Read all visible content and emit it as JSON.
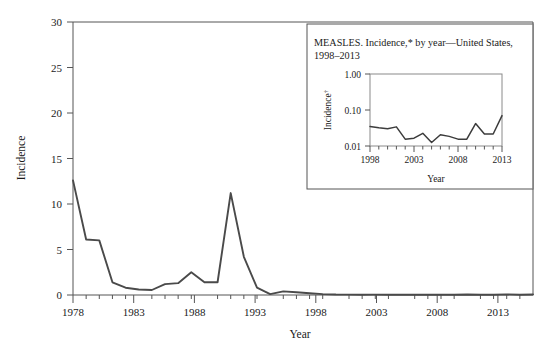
{
  "chart_data": [
    {
      "id": "main",
      "type": "line",
      "title": "",
      "xlabel": "Year",
      "ylabel": "Incidence",
      "xlim": [
        1978,
        2013
      ],
      "ylim": [
        0,
        30
      ],
      "yticks": [
        0,
        5,
        10,
        15,
        20,
        25,
        30
      ],
      "xticks": [
        1978,
        1983,
        1988,
        1993,
        1998,
        2003,
        2008,
        2013
      ],
      "xtick_labels": [
        "1978",
        "1983",
        "1988",
        "1993",
        "1998",
        "2003",
        "2008",
        "2013"
      ],
      "ytick_labels": [
        "0",
        "5",
        "10",
        "15",
        "20",
        "25",
        "30"
      ],
      "minor_xticks_every": 1,
      "grid": false,
      "legend": "none",
      "line_color": "#4a4a4a",
      "x": [
        1978,
        1979,
        1980,
        1981,
        1982,
        1983,
        1984,
        1985,
        1986,
        1987,
        1988,
        1989,
        1990,
        1991,
        1992,
        1993,
        1994,
        1995,
        1996,
        1997,
        1998,
        1999,
        2000,
        2001,
        2002,
        2003,
        2004,
        2005,
        2006,
        2007,
        2008,
        2009,
        2010,
        2011,
        2012,
        2013
      ],
      "values": [
        12.6,
        6.1,
        6.0,
        1.4,
        0.8,
        0.6,
        0.55,
        1.2,
        1.3,
        2.5,
        1.4,
        1.4,
        11.2,
        4.2,
        0.8,
        0.1,
        0.4,
        0.3,
        0.2,
        0.1,
        0.05,
        0.04,
        0.03,
        0.04,
        0.02,
        0.02,
        0.02,
        0.02,
        0.02,
        0.02,
        0.05,
        0.03,
        0.03,
        0.07,
        0.02,
        0.06
      ]
    },
    {
      "id": "inset",
      "type": "line",
      "title": "MEASLES. Incidence,* by year—United States, 1998–2013",
      "title_line1": "MEASLES. Incidence,* by year—United States,",
      "title_line2": "1998–2013",
      "xlabel": "Year",
      "ylabel": "Incidence",
      "ylabel_sup": "†",
      "yscale": "log",
      "xlim": [
        1998,
        2013
      ],
      "ylim": [
        0.01,
        1.0
      ],
      "yticks": [
        0.01,
        0.1,
        1.0
      ],
      "ytick_labels": [
        "0.01",
        "0.10",
        "1.00"
      ],
      "xticks": [
        1998,
        2003,
        2008,
        2013
      ],
      "xtick_labels": [
        "1998",
        "2003",
        "2008",
        "2013"
      ],
      "minor_xticks_every": 1,
      "grid": false,
      "legend": "none",
      "line_color": "#3c3c3c",
      "x": [
        1998,
        1999,
        2000,
        2001,
        2002,
        2003,
        2004,
        2005,
        2006,
        2007,
        2008,
        2009,
        2010,
        2011,
        2012,
        2013
      ],
      "values": [
        0.035,
        0.032,
        0.03,
        0.034,
        0.0155,
        0.0165,
        0.0225,
        0.0125,
        0.0205,
        0.0185,
        0.0155,
        0.0155,
        0.042,
        0.0215,
        0.0215,
        0.07
      ]
    }
  ],
  "main": {
    "ylabel": "Incidence",
    "xlabel": "Year"
  },
  "inset": {
    "title_line1": "MEASLES. Incidence,* by year—United States,",
    "title_line2": "1998–2013",
    "ylabel": "Incidence",
    "ylabel_sup": "†",
    "xlabel": "Year"
  }
}
